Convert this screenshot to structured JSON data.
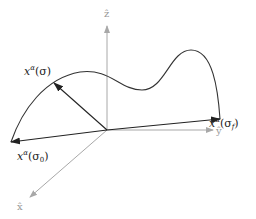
{
  "diagram": {
    "axes": {
      "z": {
        "label": "ẑ"
      },
      "y": {
        "label": "ŷ"
      },
      "x": {
        "label": "x̂"
      },
      "color": "#a8a8a8"
    },
    "vectors": {
      "sigma": {
        "label": "x",
        "sup": "α",
        "arg": "(σ)"
      },
      "sigma0": {
        "label": "x",
        "sup": "α",
        "arg": "(σ",
        "sub": "0",
        "close": ")"
      },
      "sigmaf": {
        "label": "x",
        "sup": "α",
        "arg": "(σ",
        "sub": "f",
        "close": ")"
      },
      "color": "#222222"
    },
    "curve": {
      "color": "#333333"
    }
  }
}
